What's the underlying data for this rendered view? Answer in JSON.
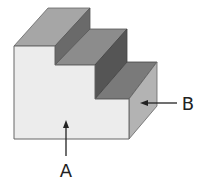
{
  "diagram": {
    "labels": {
      "a": "A",
      "b": "B"
    },
    "colors": {
      "front_face": "#ececec",
      "top_tread": "#a6a6a6",
      "mid_tread": "#8c8c8c",
      "low_tread": "#7a7a7a",
      "riser_upper": "#6a6a6a",
      "riser_lower": "#555555",
      "right_face": "#b3b3b3",
      "outline": "#555555",
      "arrow": "#222222"
    },
    "annotations": [
      {
        "label": "A",
        "points_to": "front face",
        "direction": "up"
      },
      {
        "label": "B",
        "points_to": "right side face",
        "direction": "left"
      }
    ]
  }
}
